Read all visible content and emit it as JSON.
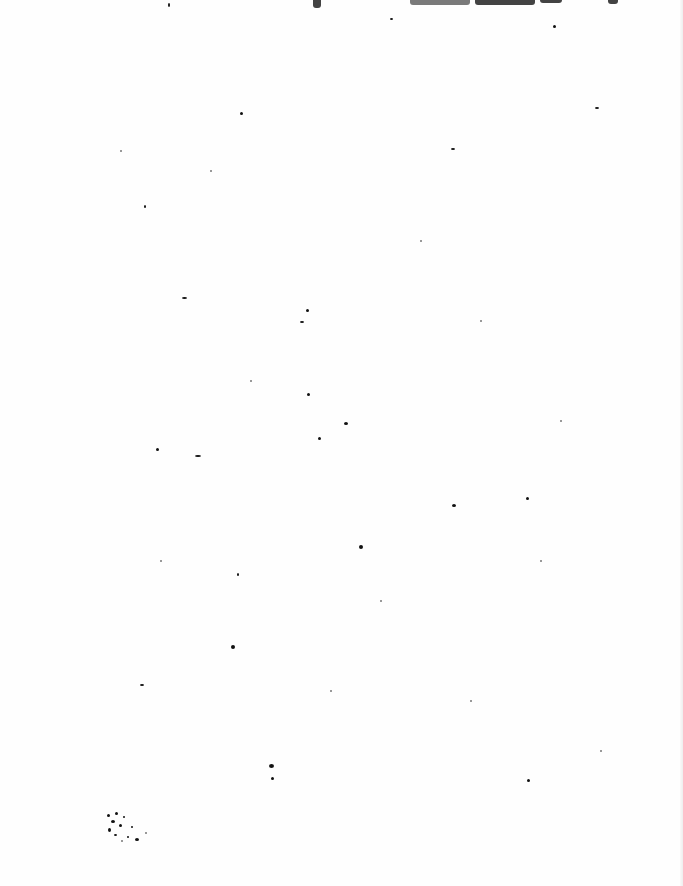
{
  "document": {
    "type": "blank scanned page",
    "text": ""
  }
}
